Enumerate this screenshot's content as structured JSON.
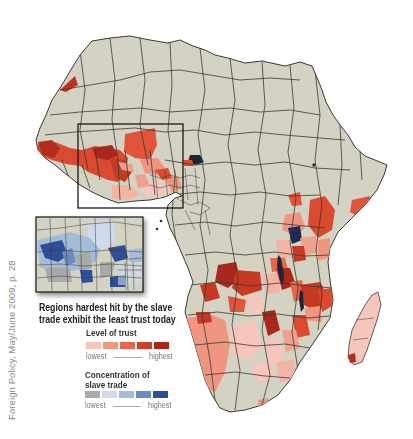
{
  "map": {
    "subject": "Africa",
    "caption": [
      "Regions hardest hit by the slave",
      "trade exhibit the least trust today"
    ],
    "citation": "Foreign Policy, May/June 2009, p. 28",
    "colors": {
      "land": "#d3d2c3",
      "border": "#3b3b35",
      "water": "#ffffff",
      "inset_frame": "#1a1a1a"
    },
    "main_map_layer": "Level of trust",
    "inset": {
      "label": "Inset of West Africa",
      "layer": "Concentration of slave trade",
      "highlight_box_on_main_map": true
    }
  },
  "legend": {
    "trust": {
      "title": "Level of trust",
      "low_label": "lowest",
      "high_label": "highest",
      "swatches": [
        "#f6c6bd",
        "#ef9580",
        "#e8674a",
        "#d23e25",
        "#a9281b"
      ]
    },
    "slave_trade": {
      "title_lines": [
        "Concentration of",
        "slave trade"
      ],
      "low_label": "lowest",
      "high_label": "highest",
      "swatches": [
        "#a9a9a9",
        "#cfdbea",
        "#a5bcd9",
        "#6a8cc0",
        "#2d4f99"
      ]
    }
  }
}
